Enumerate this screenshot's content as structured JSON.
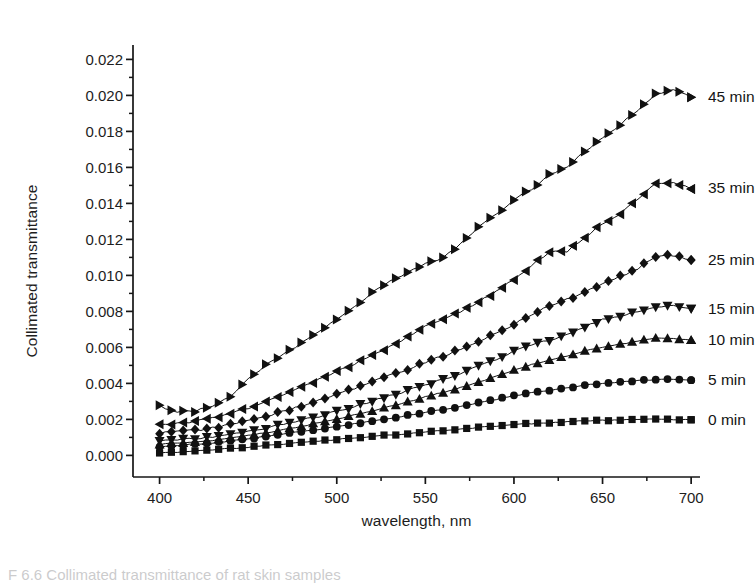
{
  "figure": {
    "caption": "F 6.6  Collimated transmittance of rat skin samples",
    "background_color": "#ffffff",
    "ink_color": "#161616"
  },
  "axes": {
    "plot_left": 133,
    "plot_right": 700,
    "plot_top": 45,
    "plot_bottom": 477,
    "y_title": "Collimated transmittance",
    "x_title": "wavelength, nm",
    "x_ticks": [
      400,
      450,
      500,
      550,
      600,
      650,
      700
    ],
    "x_tick_labels": [
      "400",
      "450",
      "500",
      "550",
      "600",
      "650",
      "700"
    ],
    "y_ticks": [
      0.0,
      0.002,
      0.004,
      0.006,
      0.008,
      0.01,
      0.012,
      0.014,
      0.016,
      0.018,
      0.02,
      0.022
    ],
    "y_tick_labels": [
      "0.000",
      "0.002",
      "0.004",
      "0.006",
      "0.008",
      "0.010",
      "0.012",
      "0.014",
      "0.016",
      "0.018",
      "0.020",
      "0.022"
    ],
    "x_minor_step": 25,
    "y_minor_step": 0.001,
    "grid": false,
    "tick_direction": "out",
    "spines": [
      "left",
      "bottom"
    ]
  },
  "chart_data": {
    "type": "line",
    "title": "",
    "subtitle": "",
    "xlabel": "wavelength, nm",
    "ylabel": "Collimated transmittance",
    "xlim": [
      385,
      705
    ],
    "ylim": [
      -0.0012,
      0.0228
    ],
    "grid": false,
    "legend_position": "right-of-series-ends",
    "annotations": [
      "45 min",
      "35 min",
      "25 min",
      "15 min",
      "10 min",
      "5 min",
      "0 min"
    ],
    "x": [
      400,
      410,
      420,
      430,
      440,
      450,
      460,
      470,
      480,
      490,
      500,
      510,
      520,
      530,
      540,
      550,
      560,
      570,
      580,
      590,
      600,
      610,
      620,
      630,
      640,
      650,
      660,
      670,
      680,
      690,
      700
    ],
    "series": [
      {
        "name": "45 min",
        "marker": "right-triangle",
        "color": "#111111",
        "label_x": 705,
        "label_y": 0.0199,
        "values": [
          0.00272,
          0.00243,
          0.00246,
          0.00272,
          0.0033,
          0.00425,
          0.005,
          0.0056,
          0.00625,
          0.0069,
          0.0076,
          0.0083,
          0.00905,
          0.00965,
          0.0102,
          0.01065,
          0.01095,
          0.0118,
          0.01265,
          0.0134,
          0.0142,
          0.0148,
          0.0156,
          0.016,
          0.0169,
          0.0176,
          0.0184,
          0.0192,
          0.0201,
          0.0203,
          0.0199
        ]
      },
      {
        "name": "35 min",
        "marker": "left-triangle",
        "color": "#111111",
        "label_x": 705,
        "label_y": 0.01485,
        "values": [
          0.0017,
          0.00175,
          0.0019,
          0.00205,
          0.0023,
          0.00262,
          0.003,
          0.0034,
          0.0038,
          0.00422,
          0.00465,
          0.0051,
          0.0056,
          0.00605,
          0.0066,
          0.00715,
          0.0076,
          0.008,
          0.00855,
          0.0091,
          0.0098,
          0.01055,
          0.0113,
          0.01135,
          0.01215,
          0.01285,
          0.01345,
          0.0142,
          0.0151,
          0.0152,
          0.0148
        ]
      },
      {
        "name": "25 min",
        "marker": "diamond",
        "color": "#111111",
        "label_x": 705,
        "label_y": 0.01085,
        "values": [
          0.00125,
          0.0013,
          0.0014,
          0.00152,
          0.0017,
          0.00192,
          0.00218,
          0.00245,
          0.00275,
          0.00305,
          0.00338,
          0.00372,
          0.00408,
          0.00443,
          0.0048,
          0.00518,
          0.00552,
          0.0059,
          0.0063,
          0.00678,
          0.0073,
          0.0078,
          0.0083,
          0.00868,
          0.00905,
          0.0095,
          0.00995,
          0.0104,
          0.01105,
          0.0111,
          0.01085
        ]
      },
      {
        "name": "15 min",
        "marker": "down-triangle",
        "color": "#111111",
        "label_x": 705,
        "label_y": 0.00815,
        "values": [
          0.00078,
          0.00085,
          0.00092,
          0.00102,
          0.00115,
          0.00132,
          0.00152,
          0.00172,
          0.00195,
          0.00218,
          0.00245,
          0.00272,
          0.003,
          0.0033,
          0.0036,
          0.00392,
          0.0042,
          0.00455,
          0.00495,
          0.00535,
          0.0058,
          0.00615,
          0.0064,
          0.00675,
          0.00715,
          0.00752,
          0.00775,
          0.008,
          0.00828,
          0.0083,
          0.00815
        ]
      },
      {
        "name": "10 min",
        "marker": "up-triangle",
        "color": "#111111",
        "label_x": 705,
        "label_y": 0.0064,
        "values": [
          0.00062,
          0.00068,
          0.00075,
          0.00083,
          0.00095,
          0.0011,
          0.00126,
          0.00143,
          0.00162,
          0.00182,
          0.00203,
          0.00225,
          0.00248,
          0.00272,
          0.00298,
          0.00325,
          0.0035,
          0.00378,
          0.00408,
          0.0044,
          0.00475,
          0.00505,
          0.00528,
          0.00552,
          0.0058,
          0.006,
          0.00618,
          0.00635,
          0.0065,
          0.0065,
          0.0064
        ]
      },
      {
        "name": "5 min",
        "marker": "circle",
        "color": "#111111",
        "label_x": 705,
        "label_y": 0.00418,
        "values": [
          0.00048,
          0.00055,
          0.00062,
          0.0007,
          0.0008,
          0.00092,
          0.00105,
          0.00118,
          0.00132,
          0.00145,
          0.0016,
          0.00175,
          0.0019,
          0.00205,
          0.00222,
          0.0024,
          0.00255,
          0.00272,
          0.00292,
          0.00312,
          0.00332,
          0.00348,
          0.0036,
          0.00375,
          0.0039,
          0.004,
          0.00408,
          0.00415,
          0.00422,
          0.00422,
          0.00418
        ]
      },
      {
        "name": "0 min",
        "marker": "square",
        "color": "#111111",
        "label_x": 705,
        "label_y": 0.00198,
        "values": [
          0.00012,
          0.00018,
          0.00024,
          0.0003,
          0.00038,
          0.00046,
          0.00055,
          0.00063,
          0.00072,
          0.0008,
          0.00089,
          0.00097,
          0.00105,
          0.00113,
          0.00121,
          0.0013,
          0.00138,
          0.00146,
          0.00155,
          0.00163,
          0.00171,
          0.00177,
          0.00182,
          0.00187,
          0.00191,
          0.00194,
          0.00197,
          0.00199,
          0.002,
          0.002,
          0.00198
        ]
      }
    ]
  }
}
